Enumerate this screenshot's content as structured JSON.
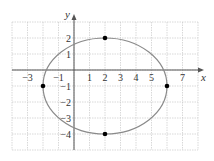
{
  "chart_data": {
    "type": "scatter",
    "title": "",
    "xlabel": "x",
    "ylabel": "y",
    "xlim": [
      -4,
      8
    ],
    "ylim": [
      -5,
      3
    ],
    "grid": true,
    "x_ticks": [
      "-3",
      "-1",
      "1",
      "2",
      "3",
      "4",
      "5",
      "7"
    ],
    "y_ticks": [
      "2",
      "1",
      "-1",
      "-2",
      "-3",
      "-4"
    ],
    "curve": {
      "shape": "ellipse",
      "center": [
        2,
        -1
      ],
      "semi_axis_x": 4,
      "semi_axis_y": 3,
      "equation": "(x-2)^2/16 + (y+1)^2/9 = 1"
    },
    "points": [
      {
        "x": 2,
        "y": 2
      },
      {
        "x": 2,
        "y": -4
      },
      {
        "x": -2,
        "y": -1
      },
      {
        "x": 6,
        "y": -1
      }
    ],
    "colors": {
      "curve": "#8a8a8a",
      "grid": "#c8c8c8",
      "axes": "#555555",
      "points": "#000000"
    }
  }
}
